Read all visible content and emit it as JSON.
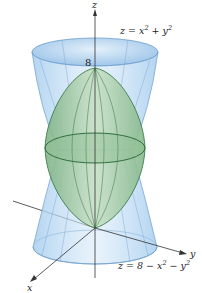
{
  "figure": {
    "type": "3d-surface-diagram",
    "axes": {
      "x_label": "x",
      "y_label": "y",
      "z_label": "z"
    },
    "z_tick": "8",
    "surfaces": [
      {
        "name": "cone",
        "equation_lhs": "z = x",
        "equation_mid": " + y",
        "equation_text": "z = x^2 + y^2",
        "color": "#a9cfee"
      },
      {
        "name": "ellipsoid",
        "equation_lhs": "z = 8 − x",
        "equation_mid": " − y",
        "equation_text": "z = 8 − x^2 − y^2",
        "color": "#9cc79f"
      }
    ],
    "exp": "2",
    "colors": {
      "outer_surface_fill": "#bcdaf3",
      "outer_surface_edge": "#6f9fcc",
      "inner_surface_fill": "#a9cfa9",
      "inner_surface_edge": "#3e7d4e",
      "axis": "#333333"
    }
  }
}
